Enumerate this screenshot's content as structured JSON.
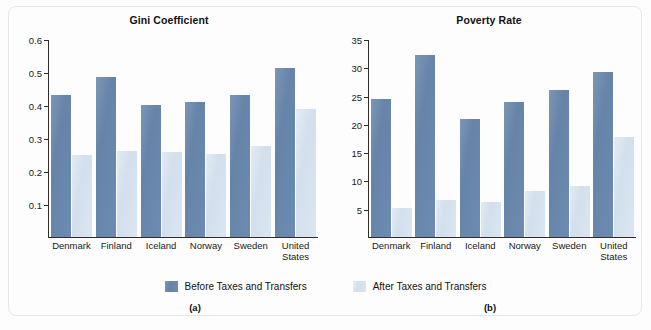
{
  "figure": {
    "legend": [
      {
        "key": "before",
        "label": "Before Taxes and Transfers",
        "color": "#6d8bb0"
      },
      {
        "key": "after",
        "label": "After Taxes and Transfers",
        "color": "#d6e2ef"
      }
    ],
    "captions": {
      "a": "(a)",
      "b": "(b)"
    }
  },
  "chart_data": [
    {
      "panel": "a",
      "type": "bar",
      "title": "Gini Coefficient",
      "xlabel": "",
      "ylabel": "",
      "ylim": [
        0,
        0.6
      ],
      "yticks": [
        0.1,
        0.2,
        0.3,
        0.4,
        0.5,
        0.6
      ],
      "ytick_labels": [
        "0.1",
        "0.2",
        "0.3",
        "0.4",
        "0.5",
        "0.6"
      ],
      "grid": false,
      "legend_position": "bottom-center",
      "categories": [
        "Denmark",
        "Finland",
        "Iceland",
        "Norway",
        "Sweden",
        "United States"
      ],
      "series": [
        {
          "name": "Before Taxes and Transfers",
          "color": "#6d8bb0",
          "values": [
            0.433,
            0.487,
            0.401,
            0.411,
            0.432,
            0.515
          ]
        },
        {
          "name": "After Taxes and Transfers",
          "color": "#d6e2ef",
          "values": [
            0.25,
            0.261,
            0.258,
            0.252,
            0.277,
            0.389
          ]
        }
      ]
    },
    {
      "panel": "b",
      "type": "bar",
      "title": "Poverty Rate",
      "xlabel": "",
      "ylabel": "",
      "ylim": [
        0,
        35
      ],
      "yticks": [
        5,
        10,
        15,
        20,
        25,
        30,
        35
      ],
      "ytick_labels": [
        "5",
        "10",
        "15",
        "20",
        "25",
        "30",
        "35"
      ],
      "grid": false,
      "legend_position": "bottom-center",
      "categories": [
        "Denmark",
        "Finland",
        "Iceland",
        "Norway",
        "Sweden",
        "United States"
      ],
      "series": [
        {
          "name": "Before Taxes and Transfers",
          "color": "#6d8bb0",
          "values": [
            24.6,
            32.4,
            21.0,
            23.9,
            26.1,
            29.4
          ]
        },
        {
          "name": "After Taxes and Transfers",
          "color": "#d6e2ef",
          "values": [
            5.2,
            6.5,
            6.2,
            8.1,
            9.1,
            17.8
          ]
        }
      ]
    }
  ]
}
